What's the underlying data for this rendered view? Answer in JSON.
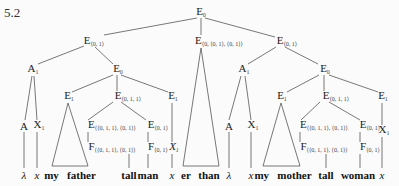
{
  "figure_number": "5.2",
  "nodes": {
    "root": {
      "label": "E",
      "sub": "0"
    },
    "l_e01": {
      "label": "E",
      "sub": "⟨0, 1⟩"
    },
    "m_e": {
      "label": "E",
      "sub": "⟨0, ⟨0, 1⟩, ⟨0, 1⟩⟩"
    },
    "r_e01": {
      "label": "E",
      "sub": "⟨0, 1⟩"
    },
    "l_a1": {
      "label": "A",
      "sub": "1"
    },
    "l_e0": {
      "label": "E",
      "sub": "0"
    },
    "r_a1": {
      "label": "A",
      "sub": "1"
    },
    "r_e0": {
      "label": "E",
      "sub": "0"
    },
    "l_e1a": {
      "label": "E",
      "sub": "1"
    },
    "l_e011": {
      "label": "E",
      "sub": "⟨0, 1, 1⟩"
    },
    "l_e1b": {
      "label": "E",
      "sub": "1"
    },
    "r_e1a": {
      "label": "E",
      "sub": "1"
    },
    "r_e011": {
      "label": "E",
      "sub": "⟨0, 1, 1⟩"
    },
    "r_e1b": {
      "label": "E",
      "sub": "1"
    },
    "l_A": {
      "label": "A",
      "sub": ""
    },
    "l_X1": {
      "label": "X",
      "sub": "1"
    },
    "l_ecomp": {
      "label": "E",
      "sub": "⟨⟨0, 1, 1⟩, ⟨0, 1⟩⟩"
    },
    "l_e01b": {
      "label": "E",
      "sub": "⟨0, 1⟩"
    },
    "r_A": {
      "label": "A",
      "sub": ""
    },
    "r_X1": {
      "label": "X",
      "sub": "1"
    },
    "r_ecomp": {
      "label": "E",
      "sub": "⟨⟨0, 1, 1⟩, ⟨0, 1⟩⟩"
    },
    "r_e01b": {
      "label": "E",
      "sub": "⟨0, 1⟩"
    },
    "r_X1b": {
      "label": "X",
      "sub": "1"
    },
    "l_fcomp": {
      "label": "F",
      "sub": "⟨⟨0, 1, 1⟩, ⟨0, 1⟩⟩"
    },
    "l_f01": {
      "label": "F",
      "sub": "⟨0, 1⟩"
    },
    "l_X1c": {
      "label": "X",
      "sub": "1"
    },
    "r_fcomp": {
      "label": "F",
      "sub": "⟨⟨0, 1, 1⟩, ⟨0, 1⟩⟩"
    },
    "r_f01": {
      "label": "F",
      "sub": "⟨0, 1⟩"
    }
  },
  "leaves": {
    "l_lambda": "λ",
    "l_x": "x",
    "l_myfather": "my   father",
    "l_tall": "tall",
    "l_man": "man",
    "l_x2": "x",
    "m_er": "er",
    "m_than": "than",
    "r_lambda": "λ",
    "r_x": "x",
    "r_mymother": "my   mother",
    "r_tall": "tall",
    "r_woman": "woman",
    "r_x2": "x"
  }
}
